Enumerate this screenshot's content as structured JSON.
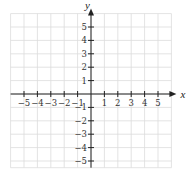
{
  "chart_data": {
    "type": "scatter",
    "title": "",
    "subtitle": "",
    "xlabel": "x",
    "ylabel": "y",
    "xlim": [
      -6,
      6
    ],
    "ylim": [
      -5.5,
      6
    ],
    "grid": true,
    "legend": null,
    "x_ticks": [
      -5,
      -4,
      -3,
      -2,
      -1,
      1,
      2,
      3,
      4,
      5
    ],
    "x_tick_labels": [
      "−5",
      "−4",
      "−3",
      "−2",
      "−1",
      "1",
      "2",
      "3",
      "4",
      "5"
    ],
    "y_ticks": [
      5,
      4,
      3,
      2,
      1,
      -1,
      -2,
      -3,
      -4,
      -5
    ],
    "y_tick_labels": [
      "5",
      "4",
      "3",
      "2",
      "1",
      "−1",
      "−2",
      "−3",
      "−4",
      "−5"
    ],
    "series": [],
    "annotations": []
  },
  "layout": {
    "origin_px": [
      91,
      94
    ],
    "unit_px": 13.4,
    "grid_color": "#dcdcdc",
    "axis_color": "#222222"
  }
}
